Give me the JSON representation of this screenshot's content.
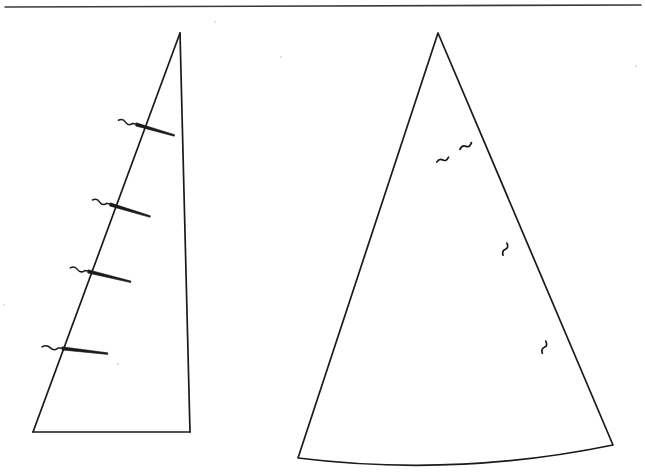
{
  "document": {
    "type": "line-drawing",
    "title": "Two garment pattern piece outlines",
    "background_color": "#ffffff",
    "ink_color": "#1a1a1a",
    "rule_color": "#3a3a3a"
  },
  "header_rule": {
    "name": "top-horizontal-rule",
    "x1": 5,
    "y1": 7,
    "x2": 641,
    "y2": 5,
    "stroke_width": 1.6
  },
  "figures": [
    {
      "id": "left-figure",
      "label": "left-pattern-piece",
      "shape": "quadrilateral",
      "outline_points": [
        [
          180,
          33
        ],
        [
          190,
          432
        ],
        [
          33,
          432
        ],
        [
          180,
          33
        ]
      ],
      "edges": [
        {
          "name": "right-edge",
          "from": [
            180,
            33
          ],
          "to": [
            190,
            432
          ]
        },
        {
          "name": "bottom-edge",
          "from": [
            190,
            432
          ],
          "to": [
            33,
            432
          ]
        },
        {
          "name": "diagonal-edge",
          "from": [
            33,
            432
          ],
          "to": [
            180,
            33
          ]
        }
      ],
      "notch_marks": [
        {
          "index": 1,
          "cross_x": 136,
          "cross_y": 124,
          "tail_angle_deg": 12,
          "tail_len": 40,
          "stub_len": 18
        },
        {
          "index": 2,
          "cross_x": 110,
          "cross_y": 204,
          "tail_angle_deg": 13,
          "tail_len": 42,
          "stub_len": 18
        },
        {
          "index": 3,
          "cross_x": 88,
          "cross_y": 271,
          "tail_angle_deg": 10,
          "tail_len": 44,
          "stub_len": 18
        },
        {
          "index": 4,
          "cross_x": 62,
          "cross_y": 348,
          "tail_angle_deg": 3,
          "tail_len": 46,
          "stub_len": 20
        }
      ],
      "notch_count": 4
    },
    {
      "id": "right-figure",
      "label": "right-pattern-piece",
      "shape": "triangle-with-arced-base",
      "apex": [
        438,
        33
      ],
      "base_left": [
        298,
        458
      ],
      "base_right": [
        613,
        445
      ],
      "base_arc_sag": 13,
      "edges": [
        {
          "name": "left-edge",
          "from": [
            438,
            33
          ],
          "to": [
            298,
            458
          ]
        },
        {
          "name": "right-edge",
          "from": [
            438,
            33
          ],
          "to": [
            613,
            445
          ]
        },
        {
          "name": "base-arc",
          "from": [
            298,
            458
          ],
          "to": [
            613,
            445
          ]
        }
      ],
      "wavy_marks": [
        {
          "index": 1,
          "x": 468,
          "y": 145,
          "rotation_deg": -18,
          "scale": 1.0
        },
        {
          "index": 2,
          "x": 445,
          "y": 159,
          "rotation_deg": -10,
          "scale": 0.95
        },
        {
          "index": 3,
          "x": 506,
          "y": 247,
          "rotation_deg": -60,
          "scale": 0.95
        },
        {
          "index": 4,
          "x": 545,
          "y": 345,
          "rotation_deg": -62,
          "scale": 0.95
        }
      ],
      "wavy_mark_count": 4
    }
  ],
  "scan_artifacts": {
    "specks": [
      {
        "x": 215,
        "y": 22,
        "r": 1.1
      },
      {
        "x": 636,
        "y": 66,
        "r": 1.2
      },
      {
        "x": 281,
        "y": 57,
        "r": 1.0
      },
      {
        "x": 118,
        "y": 364,
        "r": 0.9
      },
      {
        "x": 4,
        "y": 305,
        "r": 1.0
      }
    ]
  }
}
